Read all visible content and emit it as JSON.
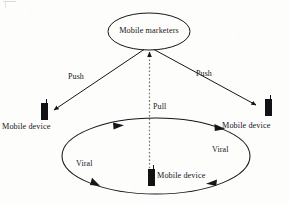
{
  "figure": {
    "kind": "flow-diagram",
    "background_color": "#fdfdfc",
    "line_color": "#16161a"
  },
  "nodes": {
    "marketers": {
      "label": "Mobile marketers",
      "shape": "ellipse"
    },
    "device_left": {
      "label": "Mobile device",
      "icon": "mobile-device-icon"
    },
    "device_right": {
      "label": "Mobile device",
      "icon": "mobile-device-icon"
    },
    "device_bottom": {
      "label": "Mobile device",
      "icon": "mobile-device-icon"
    }
  },
  "edges": {
    "push_left": {
      "label": "Push",
      "style": "solid",
      "from": "marketers",
      "to": "device_left"
    },
    "push_right": {
      "label": "Push",
      "style": "solid",
      "from": "marketers",
      "to": "device_right"
    },
    "pull": {
      "label": "Pull",
      "style": "dotted",
      "from": "device_bottom",
      "to": "marketers"
    },
    "viral_left": {
      "label": "Viral",
      "style": "solid",
      "direction": "clockwise"
    },
    "viral_right": {
      "label": "Viral",
      "style": "solid",
      "direction": "clockwise"
    }
  },
  "viral_loop": {
    "shape": "ellipse",
    "direction": "clockwise",
    "arrowhead_count": 4
  }
}
